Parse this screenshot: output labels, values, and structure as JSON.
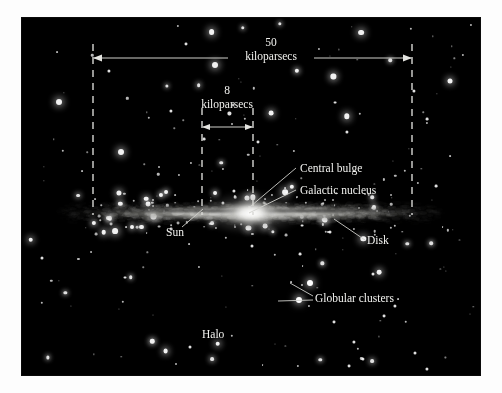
{
  "diagram": {
    "background_color": "#000000",
    "text_color": "#f2f2ef",
    "frame_color": "#fdfdfd"
  },
  "scale_bars": [
    {
      "id": "galaxy-diameter",
      "value": "50",
      "unit": "kiloparsecs",
      "description": "full disk diameter"
    },
    {
      "id": "sun-distance",
      "value": "8",
      "unit": "kiloparsecs",
      "description": "distance from Sun to Galactic center"
    }
  ],
  "labels": {
    "central_bulge": "Central bulge",
    "galactic_nucleus": "Galactic nucleus",
    "disk": "Disk",
    "sun": "Sun",
    "globular_clusters": "Globular clusters",
    "halo": "Halo"
  },
  "chart_data": {
    "type": "diagram",
    "components": [
      {
        "name": "Central bulge",
        "label": "Central bulge"
      },
      {
        "name": "Galactic nucleus",
        "label": "Galactic nucleus"
      },
      {
        "name": "Disk",
        "label": "Disk"
      },
      {
        "name": "Sun",
        "label": "Sun"
      },
      {
        "name": "Globular clusters",
        "label": "Globular clusters"
      },
      {
        "name": "Halo",
        "label": "Halo"
      }
    ],
    "measurements": [
      {
        "quantity": "disk diameter",
        "value": 50,
        "unit": "kiloparsecs"
      },
      {
        "quantity": "Sun to Galactic center",
        "value": 8,
        "unit": "kiloparsecs"
      }
    ]
  }
}
